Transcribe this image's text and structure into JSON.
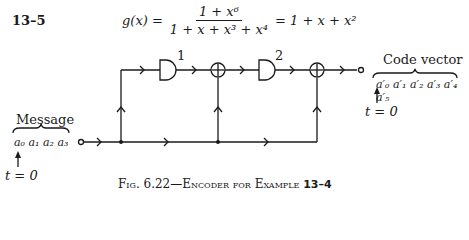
{
  "problem": {
    "number": "13–5",
    "formula": {
      "lhs": "g(x) =",
      "numerator": "1 + x⁶",
      "denominator": "1 + x + x³ + x⁴",
      "rhs": "= 1 + x + x²"
    }
  },
  "diagram": {
    "gates": [
      {
        "label": "1",
        "type": "shift-register-delay"
      },
      {
        "label": "2",
        "type": "shift-register-delay"
      }
    ],
    "adders": [
      "mod-2 adder 1",
      "mod-2 adder 2"
    ],
    "input": {
      "title": "Message",
      "sequence": "a₀ a₁ a₂ a₃",
      "time_label": "t = 0"
    },
    "output": {
      "title": "Code vector",
      "sequence": "a′₀ a′₁ a′₂ a′₃ a′₄ a′₅",
      "time_label": "t = 0"
    }
  },
  "caption": {
    "prefix": "Fig. 6.22—Encoder for Example ",
    "example": "13–4"
  }
}
